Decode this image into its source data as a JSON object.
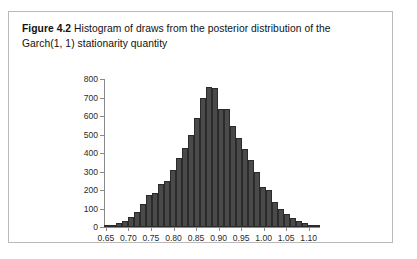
{
  "figure": {
    "label": "Figure 4.2",
    "title_line1": "Histogram of draws from the posterior distribution of the",
    "title_line2": "Garch(1, 1) stationarity quantity"
  },
  "colors": {
    "bar_fill": "#4a4a4a",
    "bar_stroke": "#2b2b2b",
    "axis": "#8a8a8a",
    "frame": "#b9b9b9",
    "text": "#111111"
  },
  "chart_data": {
    "type": "bar",
    "title": "Histogram of draws from the posterior distribution of the Garch(1, 1) stationarity quantity",
    "xlabel": "",
    "ylabel": "",
    "grid": false,
    "legend": "none",
    "xlim": [
      0.6458,
      1.125
    ],
    "ylim": [
      0,
      800
    ],
    "ytick_labels": [
      "0",
      "100",
      "200",
      "300",
      "400",
      "500",
      "600",
      "700",
      "800"
    ],
    "ytick_values": [
      0,
      100,
      200,
      300,
      400,
      500,
      600,
      700,
      800
    ],
    "xtick_labels": [
      "0.65",
      "0.70",
      "0.75",
      "0.80",
      "0.85",
      "0.90",
      "0.95",
      "1.00",
      "1.05",
      "1.10"
    ],
    "xtick_values": [
      0.65,
      0.7,
      0.75,
      0.8,
      0.85,
      0.9,
      0.95,
      1.0,
      1.05,
      1.1
    ],
    "bin_width": 0.0133,
    "bin_left_edges": [
      0.6458,
      0.6591,
      0.6724,
      0.6857,
      0.699,
      0.7123,
      0.7256,
      0.7389,
      0.7522,
      0.7655,
      0.7788,
      0.7921,
      0.8054,
      0.8187,
      0.832,
      0.8453,
      0.8586,
      0.8719,
      0.8852,
      0.8985,
      0.9118,
      0.9251,
      0.9384,
      0.9517,
      0.965,
      0.9783,
      0.9916,
      1.0049,
      1.0182,
      1.0315,
      1.0448,
      1.0581,
      1.0714,
      1.0847,
      1.098,
      1.1113
    ],
    "categories": [
      "0.646",
      "0.659",
      "0.672",
      "0.686",
      "0.699",
      "0.712",
      "0.726",
      "0.739",
      "0.752",
      "0.766",
      "0.779",
      "0.792",
      "0.805",
      "0.819",
      "0.832",
      "0.845",
      "0.859",
      "0.872",
      "0.885",
      "0.899",
      "0.912",
      "0.925",
      "0.938",
      "0.952",
      "0.965",
      "0.978",
      "0.992",
      "1.005",
      "1.018",
      "1.031",
      "1.045",
      "1.058",
      "1.071",
      "1.085",
      "1.098",
      "1.111"
    ],
    "values": [
      5,
      10,
      20,
      35,
      55,
      80,
      125,
      175,
      185,
      230,
      250,
      310,
      375,
      425,
      500,
      590,
      700,
      755,
      750,
      640,
      640,
      545,
      480,
      420,
      360,
      300,
      215,
      200,
      135,
      95,
      70,
      50,
      35,
      20,
      12,
      5
    ]
  }
}
